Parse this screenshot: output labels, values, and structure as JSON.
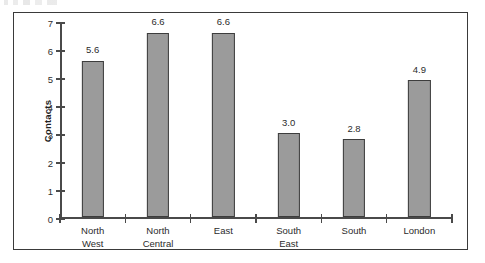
{
  "chart_data": {
    "type": "bar",
    "title": "",
    "subtitle": "",
    "xlabel": "",
    "ylabel": "Contacts",
    "categories": [
      "North West",
      "North Central",
      "East",
      "South East",
      "South",
      "London"
    ],
    "category_lines": [
      [
        "North",
        "West"
      ],
      [
        "North",
        "Central"
      ],
      [
        "East"
      ],
      [
        "South",
        "East"
      ],
      [
        "South"
      ],
      [
        "London"
      ]
    ],
    "values": [
      5.6,
      6.6,
      6.6,
      3.0,
      2.8,
      4.9
    ],
    "value_labels": [
      "5.6",
      "6.6",
      "6.6",
      "3.0",
      "2.8",
      "4.9"
    ],
    "ylim": [
      0,
      7
    ],
    "ytick_labels": [
      "0",
      "1",
      "2",
      "3",
      "4",
      "5",
      "6",
      "7"
    ],
    "ytick_values": [
      0,
      1,
      2,
      3,
      4,
      5,
      6,
      7
    ],
    "grid": false,
    "legend": null,
    "bar_color": "#9b9b9b",
    "bar_border_color": "#3d3d3d",
    "axis_color": "#4a4a4a",
    "frame_color": "#3a3a3a"
  }
}
